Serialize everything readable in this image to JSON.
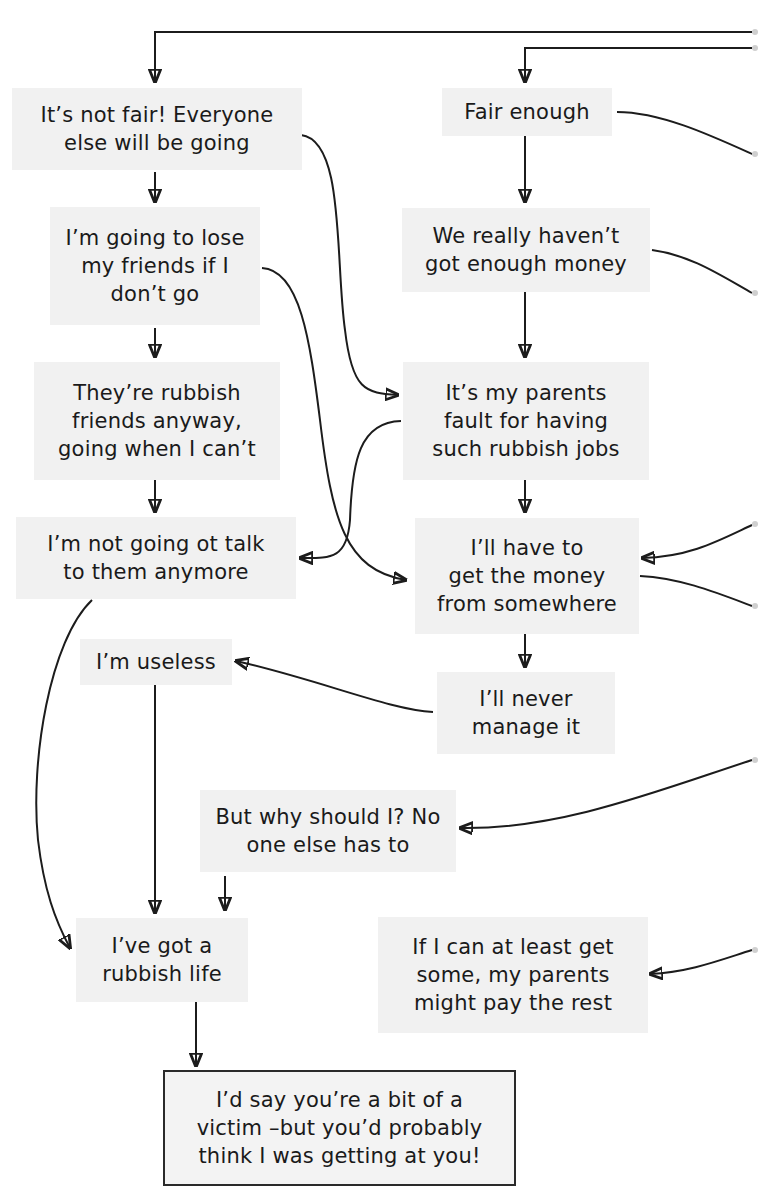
{
  "diagram": {
    "type": "flowchart",
    "colors": {
      "node_fill": "#f1f1f1",
      "line": "#1c1c1c",
      "final_border": "#2a2a2a"
    },
    "nodes": [
      {
        "id": "A",
        "text": "It’s not fair! Everyone\nelse will be going"
      },
      {
        "id": "B",
        "text": "Fair enough"
      },
      {
        "id": "C",
        "text": "I’m going to lose\nmy friends if I\ndon’t go"
      },
      {
        "id": "D",
        "text": "We really haven’t\ngot enough money"
      },
      {
        "id": "E",
        "text": "They’re rubbish\nfriends anyway,\ngoing when I can’t"
      },
      {
        "id": "F",
        "text": "It’s my parents\nfault for having\nsuch rubbish jobs"
      },
      {
        "id": "G",
        "text": "I’m not going ot talk\nto them anymore"
      },
      {
        "id": "H",
        "text": "I’ll have to\nget the money\nfrom somewhere"
      },
      {
        "id": "I",
        "text": "I’m useless"
      },
      {
        "id": "J",
        "text": "I’ll never\nmanage it"
      },
      {
        "id": "K",
        "text": "But why should I? No\none else has to"
      },
      {
        "id": "L",
        "text": "I’ve got a\nrubbish life"
      },
      {
        "id": "M",
        "text": "If I can at least get\nsome, my parents\nmight pay the rest"
      },
      {
        "id": "N",
        "text": "I’d say you’re a bit of a\nvictim –but you’d probably\nthink I was getting at you!",
        "final": true
      }
    ],
    "edges": [
      {
        "from": "offpage-right-1",
        "to": "A"
      },
      {
        "from": "offpage-right-2",
        "to": "B"
      },
      {
        "from": "B",
        "to": "offpage-right-3"
      },
      {
        "from": "A",
        "to": "C"
      },
      {
        "from": "A",
        "to": "F"
      },
      {
        "from": "B",
        "to": "D"
      },
      {
        "from": "D",
        "to": "offpage-right-4"
      },
      {
        "from": "C",
        "to": "E"
      },
      {
        "from": "C",
        "to": "H"
      },
      {
        "from": "D",
        "to": "F"
      },
      {
        "from": "E",
        "to": "G"
      },
      {
        "from": "F",
        "to": "G"
      },
      {
        "from": "F",
        "to": "H"
      },
      {
        "from": "offpage-right-5",
        "to": "H"
      },
      {
        "from": "H",
        "to": "offpage-right-6"
      },
      {
        "from": "H",
        "to": "J"
      },
      {
        "from": "J",
        "to": "I"
      },
      {
        "from": "G",
        "to": "L"
      },
      {
        "from": "I",
        "to": "L"
      },
      {
        "from": "offpage-right-7",
        "to": "K"
      },
      {
        "from": "K",
        "to": "L"
      },
      {
        "from": "offpage-right-8",
        "to": "M"
      },
      {
        "from": "L",
        "to": "N"
      }
    ]
  }
}
